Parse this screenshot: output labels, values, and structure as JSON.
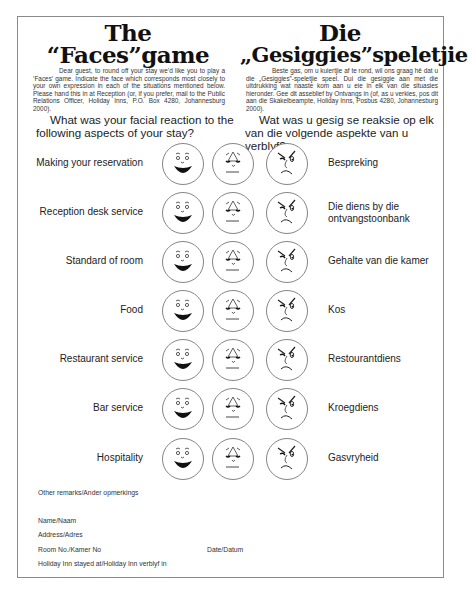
{
  "header": {
    "english": {
      "title_line1": "The",
      "title_line2": "“Faces”game",
      "intro": "Dear guest, to round off your stay we’d like you to play a ‘Faces’ game. Indicate the face which corresponds most closely to your own expression in each of the situations mentioned below. Please hand this in at Reception (or, if you prefer, mail to the Public Relations Officer, Holiday Inns, P.O. Box 4280, Johannesburg 2000).",
      "question": "What was your facial reaction to the following aspects of your stay?"
    },
    "afrikaans": {
      "title_line1": "Die",
      "title_line2": "„Gesiggies”speletjie",
      "intro": "Beste gas, om u kuiertjie af te rond, wil ons graag hê dat u die „Gesiggies”-speletjie speel. Dui die gesiggie aan met die uitdrukking wat naaste kom aan u eie in elk van die situasies hieronder. Gee dit asseblief by Ontvangs in (of, as u verkies, pos dit aan die Skakelbeampte, Holiday Inns, Posbus 4280, Johannesburg 2000).",
      "question": "Wat was u gesig se reaksie op elk van die volgende aspekte van u verblyf?"
    }
  },
  "face_options": [
    {
      "id": "happy",
      "icon": "happy-face-icon"
    },
    {
      "id": "neutral",
      "icon": "neutral-face-icon"
    },
    {
      "id": "angry",
      "icon": "angry-face-icon"
    }
  ],
  "aspects": [
    {
      "en": "Making your reservation",
      "af": "Bespreking"
    },
    {
      "en": "Reception desk service",
      "af": "Die diens by die ontvangstoonbank"
    },
    {
      "en": "Standard of room",
      "af": "Gehalte van die kamer"
    },
    {
      "en": "Food",
      "af": "Kos"
    },
    {
      "en": "Restaurant service",
      "af": "Restourantdiens"
    },
    {
      "en": "Bar service",
      "af": "Kroegdiens"
    },
    {
      "en": "Hospitality",
      "af": "Gasvryheid"
    }
  ],
  "form_fields": {
    "remarks": "Other remarks/Ander opmerkings",
    "name": "Name/Naam",
    "address": "Address/Adres",
    "room": "Room No./Kamer No",
    "date": "Date/Datum",
    "hotel": "Holiday Inn stayed at/Holiday Inn verblyf in"
  }
}
